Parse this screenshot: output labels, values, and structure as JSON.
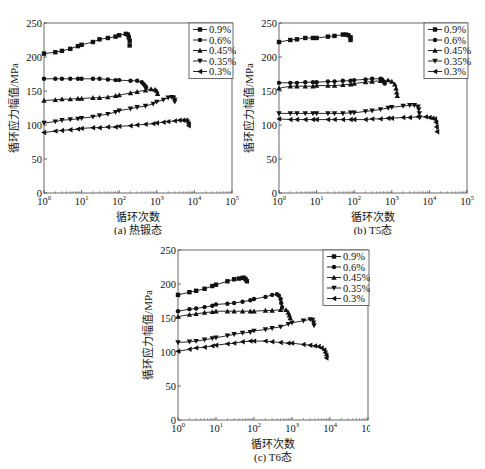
{
  "figure": {
    "xlabel": "循环次数",
    "ylabel": "循环应力幅值/MPa"
  },
  "chart_data": [
    {
      "type": "line",
      "panel": "a",
      "title": "(a) 热锻态",
      "xlabel": "循环次数",
      "ylabel": "循环应力幅值/MPa",
      "xscale": "log",
      "xlim": [
        1,
        100000
      ],
      "ylim": [
        0,
        250
      ],
      "xticks": [
        "10^0",
        "10^1",
        "10^2",
        "10^3",
        "10^4",
        "10^5"
      ],
      "yticks": [
        0,
        50,
        100,
        150,
        200,
        250
      ],
      "legend_position": "upper right",
      "series": [
        {
          "name": "0.9%",
          "marker": "square",
          "x": [
            1,
            2,
            3,
            5,
            8,
            10,
            20,
            30,
            50,
            80,
            100,
            150,
            170,
            180,
            190,
            190
          ],
          "y": [
            205,
            207,
            209,
            212,
            216,
            218,
            222,
            226,
            228,
            230,
            232,
            234,
            233,
            229,
            224,
            217
          ]
        },
        {
          "name": "0.6%",
          "marker": "circle",
          "x": [
            1,
            2,
            3,
            5,
            8,
            10,
            20,
            30,
            50,
            80,
            100,
            200,
            300,
            400,
            450,
            500,
            520
          ],
          "y": [
            168,
            168,
            168,
            168,
            168,
            168,
            168,
            168,
            167,
            166,
            166,
            165,
            165,
            163,
            160,
            157,
            155
          ]
        },
        {
          "name": "0.45%",
          "marker": "triangle-up",
          "x": [
            1,
            2,
            3,
            5,
            8,
            10,
            20,
            30,
            50,
            80,
            100,
            200,
            300,
            500,
            700,
            900,
            1000,
            1050
          ],
          "y": [
            136,
            137,
            138,
            138,
            139,
            139,
            140,
            140,
            141,
            143,
            144,
            147,
            149,
            151,
            153,
            152,
            150,
            146
          ]
        },
        {
          "name": "0.35%",
          "marker": "triangle-down",
          "x": [
            1,
            2,
            3,
            5,
            8,
            10,
            20,
            30,
            50,
            80,
            100,
            200,
            300,
            500,
            800,
            1000,
            1500,
            2000,
            2500,
            2800,
            3000,
            3000
          ],
          "y": [
            103,
            105,
            107,
            108,
            109,
            110,
            112,
            114,
            116,
            119,
            121,
            124,
            126,
            128,
            131,
            134,
            137,
            140,
            141,
            140,
            137,
            134
          ]
        },
        {
          "name": "0.3%",
          "marker": "triangle-left",
          "x": [
            1,
            2,
            3,
            5,
            8,
            10,
            20,
            30,
            50,
            80,
            100,
            200,
            300,
            500,
            800,
            1000,
            1500,
            2000,
            3000,
            4000,
            5000,
            6000,
            6500,
            7000,
            7000
          ],
          "y": [
            89,
            91,
            92,
            93,
            94,
            95,
            96,
            96,
            97,
            97,
            98,
            99,
            100,
            101,
            102,
            103,
            104,
            105,
            106,
            107,
            107,
            107,
            105,
            102,
            99
          ]
        }
      ]
    },
    {
      "type": "line",
      "panel": "b",
      "title": "(b) T5态",
      "xlabel": "循环次数",
      "ylabel": "循环应力幅值/MPa",
      "xscale": "log",
      "xlim": [
        1,
        100000
      ],
      "ylim": [
        0,
        250
      ],
      "xticks": [
        "10^0",
        "10^1",
        "10^2",
        "10^3",
        "10^4",
        "10^5"
      ],
      "yticks": [
        0,
        50,
        100,
        150,
        200,
        250
      ],
      "legend_position": "upper right",
      "series": [
        {
          "name": "0.9%",
          "marker": "square",
          "x": [
            1,
            2,
            3,
            5,
            8,
            10,
            20,
            30,
            50,
            60,
            70,
            80,
            80
          ],
          "y": [
            222,
            225,
            226,
            228,
            228,
            228,
            230,
            231,
            233,
            233,
            232,
            229,
            225
          ]
        },
        {
          "name": "0.6%",
          "marker": "circle",
          "x": [
            1,
            2,
            3,
            5,
            8,
            10,
            20,
            30,
            50,
            80,
            100,
            200,
            300,
            500,
            550,
            600,
            650
          ],
          "y": [
            162,
            162,
            162,
            163,
            163,
            163,
            164,
            164,
            165,
            165,
            166,
            167,
            168,
            168,
            167,
            164,
            161
          ]
        },
        {
          "name": "0.45%",
          "marker": "triangle-up",
          "x": [
            1,
            2,
            3,
            5,
            8,
            10,
            20,
            30,
            50,
            80,
            100,
            200,
            300,
            500,
            800,
            1000,
            1200,
            1300,
            1350,
            1400
          ],
          "y": [
            154,
            157,
            157,
            157,
            157,
            158,
            158,
            158,
            159,
            160,
            161,
            163,
            164,
            165,
            166,
            164,
            160,
            154,
            148,
            143
          ]
        },
        {
          "name": "0.35%",
          "marker": "triangle-down",
          "x": [
            1,
            2,
            3,
            5,
            8,
            10,
            20,
            30,
            50,
            80,
            100,
            200,
            300,
            500,
            800,
            1000,
            2000,
            3000,
            4000,
            5000,
            5200,
            5400,
            5500
          ],
          "y": [
            117,
            117,
            117,
            117,
            117,
            117,
            117,
            117,
            117,
            118,
            118,
            120,
            121,
            123,
            125,
            126,
            128,
            129,
            129,
            127,
            123,
            117,
            111
          ]
        },
        {
          "name": "0.3%",
          "marker": "triangle-left",
          "x": [
            1,
            2,
            3,
            5,
            8,
            10,
            20,
            30,
            50,
            80,
            100,
            200,
            300,
            500,
            800,
            1000,
            2000,
            3000,
            5000,
            8000,
            10000,
            12000,
            14000,
            15000,
            15500,
            16000
          ],
          "y": [
            109,
            108,
            108,
            108,
            108,
            108,
            108,
            108,
            108,
            108,
            108,
            108,
            109,
            109,
            110,
            110,
            111,
            111,
            112,
            112,
            111,
            110,
            109,
            104,
            97,
            90
          ]
        }
      ]
    },
    {
      "type": "line",
      "panel": "c",
      "title": "(c) T6态",
      "xlabel": "循环次数",
      "ylabel": "循环应力幅值/MPa",
      "xscale": "log",
      "xlim": [
        1,
        100000
      ],
      "ylim": [
        0,
        250
      ],
      "xticks": [
        "10^0",
        "10^1",
        "10^2",
        "10^3",
        "10^4",
        "10^5"
      ],
      "yticks": [
        0,
        50,
        100,
        150,
        200,
        250
      ],
      "legend_position": "upper right",
      "series": [
        {
          "name": "0.9%",
          "marker": "square",
          "x": [
            1,
            2,
            3,
            5,
            8,
            10,
            20,
            30,
            40,
            50,
            55,
            60,
            65
          ],
          "y": [
            184,
            188,
            190,
            193,
            197,
            199,
            204,
            207,
            208,
            209,
            209,
            207,
            204
          ]
        },
        {
          "name": "0.6%",
          "marker": "circle",
          "x": [
            1,
            2,
            3,
            5,
            8,
            10,
            20,
            30,
            50,
            80,
            100,
            200,
            300,
            400,
            450,
            500,
            520,
            550
          ],
          "y": [
            160,
            163,
            164,
            166,
            168,
            170,
            171,
            172,
            174,
            176,
            178,
            181,
            184,
            185,
            183,
            178,
            172,
            166
          ]
        },
        {
          "name": "0.45%",
          "marker": "triangle-up",
          "x": [
            1,
            2,
            3,
            5,
            8,
            10,
            20,
            30,
            50,
            80,
            100,
            200,
            300,
            500,
            700,
            800,
            850,
            900
          ],
          "y": [
            152,
            155,
            156,
            158,
            159,
            160,
            160,
            160,
            160,
            160,
            160,
            161,
            161,
            162,
            162,
            158,
            154,
            150
          ]
        },
        {
          "name": "0.35%",
          "marker": "triangle-down",
          "x": [
            1,
            2,
            3,
            5,
            8,
            10,
            20,
            30,
            50,
            80,
            100,
            200,
            300,
            500,
            800,
            1000,
            2000,
            3000,
            3500,
            3700,
            3800
          ],
          "y": [
            114,
            115,
            116,
            118,
            120,
            121,
            124,
            126,
            128,
            129,
            131,
            133,
            135,
            137,
            141,
            143,
            146,
            148,
            147,
            143,
            139
          ]
        },
        {
          "name": "0.3%",
          "marker": "triangle-left",
          "x": [
            1,
            2,
            3,
            5,
            8,
            10,
            20,
            30,
            50,
            80,
            100,
            200,
            300,
            500,
            800,
            1000,
            2000,
            3000,
            4000,
            5000,
            6000,
            7000,
            7500,
            8000,
            8000
          ],
          "y": [
            101,
            104,
            106,
            107,
            109,
            110,
            112,
            113,
            115,
            116,
            116,
            116,
            115,
            114,
            113,
            113,
            111,
            110,
            109,
            108,
            106,
            103,
            99,
            95,
            91
          ]
        }
      ]
    }
  ]
}
